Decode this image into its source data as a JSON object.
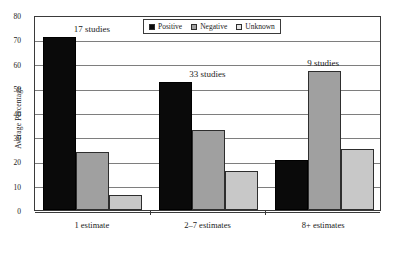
{
  "chart_data": {
    "type": "bar",
    "title": "",
    "xlabel": "",
    "ylabel": "Average Percentage",
    "ylim": [
      0,
      80
    ],
    "ytick_values": [
      80,
      70,
      60,
      50,
      40,
      30,
      20,
      10,
      0
    ],
    "grid": true,
    "legend_position": "top-center",
    "categories": [
      "1 estimate",
      "2–7 estimates",
      "8+ estimates"
    ],
    "series": [
      {
        "name": "Positive",
        "color": "#0a0a0a",
        "values": [
          71,
          52.5,
          20.5
        ]
      },
      {
        "name": "Negative",
        "color": "#a0a0a0",
        "values": [
          24,
          33,
          57
        ]
      },
      {
        "name": "Unknown",
        "color": "#c8c8c8",
        "values": [
          6,
          16,
          25
        ]
      }
    ],
    "annotations": [
      {
        "text": "17 studies",
        "category": "1 estimate"
      },
      {
        "text": "33 studies",
        "category": "2–7 estimates"
      },
      {
        "text": "9 studies",
        "category": "8+ estimates"
      }
    ]
  }
}
